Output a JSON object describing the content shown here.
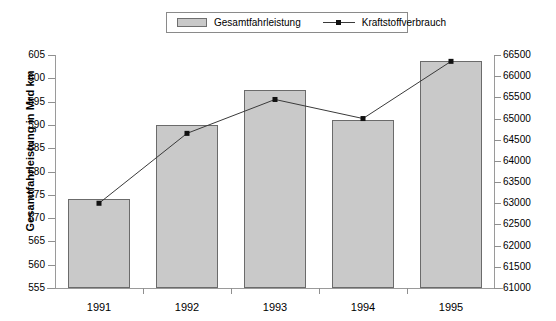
{
  "chart_data": {
    "type": "bar",
    "title": "",
    "subtitle": "",
    "categories": [
      "1991",
      "1992",
      "1993",
      "1994",
      "1995"
    ],
    "xlabel": "",
    "ylabel": "Gesamtfahrleistung in Mrd km",
    "ylabel_secondary": "",
    "ylim": [
      555,
      605
    ],
    "ylim_secondary": [
      61000,
      66500
    ],
    "ytick_step": 5,
    "ytick_step_secondary": 500,
    "yticks": [
      555,
      560,
      565,
      570,
      575,
      580,
      585,
      590,
      595,
      600,
      605
    ],
    "yticks_secondary": [
      61000,
      61500,
      62000,
      62500,
      63000,
      63500,
      64000,
      64500,
      65000,
      65500,
      66000,
      66500
    ],
    "grid": false,
    "legend_position": "top-center",
    "series": [
      {
        "name": "Gesamtfahrleistung",
        "type": "bar",
        "axis": "left",
        "color": "#c9c9c9",
        "border_color": "#6b6b6b",
        "values": [
          574,
          590,
          597.5,
          591,
          603.8
        ]
      },
      {
        "name": "Kraftstoffverbrauch",
        "type": "line",
        "axis": "right",
        "color": "#3a3a3a",
        "marker": "square",
        "marker_color": "#111111",
        "values": [
          63000,
          64650,
          65450,
          65000,
          66350
        ]
      }
    ]
  },
  "legend": {
    "bar_label": "Gesamtfahrleistung",
    "line_label": "Kraftstoffverbrauch"
  },
  "axes": {
    "y_title": "Gesamtfahrleistung in Mrd km"
  }
}
